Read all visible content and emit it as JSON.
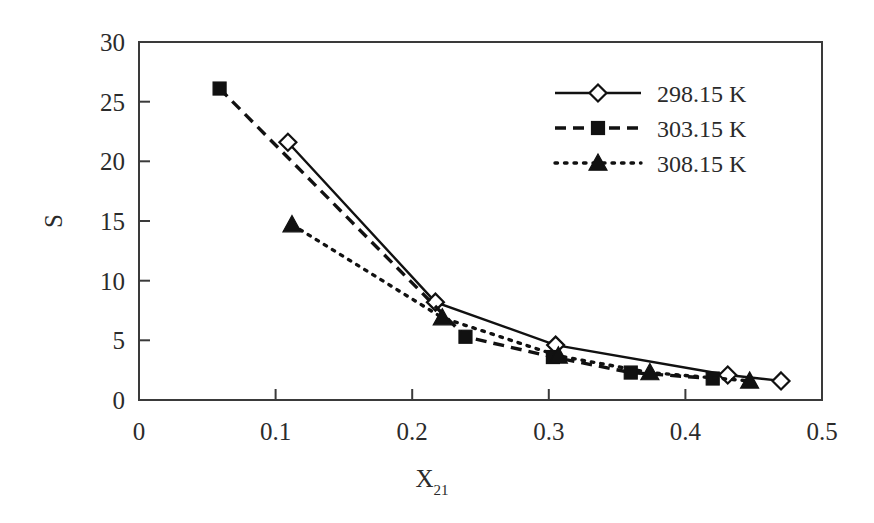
{
  "chart_data": {
    "type": "line",
    "title": "",
    "xlabel": "X21",
    "xlabel_base": "X",
    "xlabel_sub": "21",
    "ylabel": "S",
    "xlim": [
      0,
      0.5
    ],
    "ylim": [
      0,
      30
    ],
    "xticks": [
      "0",
      "0.1",
      "0.2",
      "0.3",
      "0.4",
      "0.5"
    ],
    "xtick_values": [
      0,
      0.1,
      0.2,
      0.3,
      0.4,
      0.5
    ],
    "yticks": [
      "0",
      "5",
      "10",
      "15",
      "20",
      "25",
      "30"
    ],
    "ytick_values": [
      0,
      5,
      10,
      15,
      20,
      25,
      30
    ],
    "grid": false,
    "legend_position": "top-right",
    "series": [
      {
        "name": "298.15 K",
        "marker": "open-diamond",
        "linestyle": "solid",
        "color": "#111111",
        "x": [
          0.109,
          0.217,
          0.305,
          0.431,
          0.47
        ],
        "y": [
          21.6,
          8.2,
          4.6,
          2.1,
          1.6
        ]
      },
      {
        "name": "303.15 K",
        "marker": "filled-square",
        "linestyle": "dashed",
        "color": "#111111",
        "x": [
          0.059,
          0.239,
          0.303,
          0.36,
          0.42
        ],
        "y": [
          26.1,
          5.3,
          3.6,
          2.3,
          1.8
        ]
      },
      {
        "name": "308.15 K",
        "marker": "filled-triangle",
        "linestyle": "dotted",
        "color": "#111111",
        "x": [
          0.112,
          0.222,
          0.307,
          0.374,
          0.447
        ],
        "y": [
          14.7,
          6.9,
          3.7,
          2.3,
          1.6
        ]
      }
    ]
  },
  "legend": {
    "entries": [
      {
        "label": "298.15 K",
        "marker": "open-diamond",
        "linestyle": "solid"
      },
      {
        "label": "303.15 K",
        "marker": "filled-square",
        "linestyle": "dashed"
      },
      {
        "label": "308.15 K",
        "marker": "filled-triangle",
        "linestyle": "dotted"
      }
    ]
  },
  "axes": {
    "x_title_base": "X",
    "x_title_sub": "21",
    "y_title": "S",
    "x_tick_labels": [
      "0",
      "0.1",
      "0.2",
      "0.3",
      "0.4",
      "0.5"
    ],
    "y_tick_labels": [
      "0",
      "5",
      "10",
      "15",
      "20",
      "25",
      "30"
    ]
  },
  "colors": {
    "line": "#111111",
    "frame": "#3a3a3a",
    "text": "#2b2b2b",
    "background": "#ffffff"
  }
}
